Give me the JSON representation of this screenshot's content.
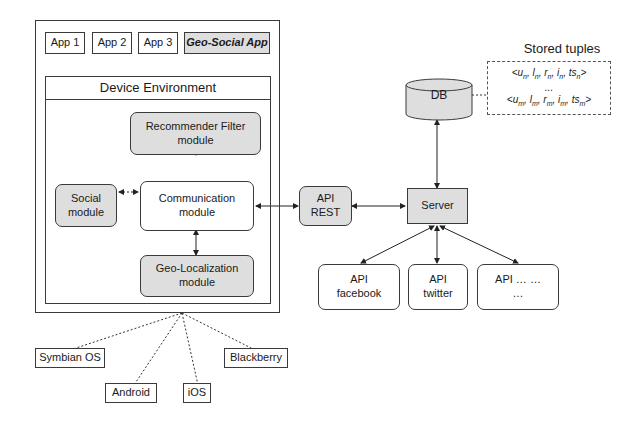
{
  "device": {
    "apps": [
      "App 1",
      "App 2",
      "App 3",
      "Geo-Social App"
    ],
    "environment_label": "Device Environment",
    "modules": {
      "recommender": "Recommender Filter module",
      "social": "Social module",
      "communication": "Communication module",
      "geo": "Geo-Localization module"
    }
  },
  "api_rest": "API REST",
  "server": "Server",
  "db": "DB",
  "stored_tuples": {
    "title": "Stored tuples",
    "rows": [
      "<u_n, l_n, r_n, i_n, ts_n>",
      "...",
      "<u_m, l_m, r_m, i_m, ts_m>"
    ]
  },
  "external_apis": [
    "API facebook",
    "API twitter",
    "API … … …"
  ],
  "platforms": [
    "Symbian OS",
    "Android",
    "iOS",
    "Blackberry"
  ],
  "colors": {
    "module_fill": "#dedede",
    "border": "#3a3a3a"
  }
}
